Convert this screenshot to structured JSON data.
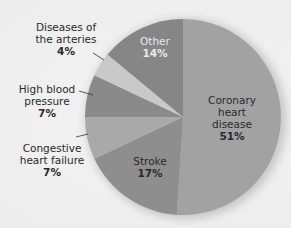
{
  "chart_data": {
    "type": "pie",
    "title": "",
    "start_angle_deg": 0,
    "direction": "clockwise",
    "slices": [
      {
        "label": "Coronary heart disease",
        "value": 51,
        "display": "51%",
        "color": "#a2a2a2"
      },
      {
        "label": "Stroke",
        "value": 17,
        "display": "17%",
        "color": "#8e8e8e"
      },
      {
        "label": "Congestive heart failure",
        "value": 7,
        "display": "7%",
        "color": "#a9a9a9"
      },
      {
        "label": "High blood pressure",
        "value": 7,
        "display": "7%",
        "color": "#8a8a8a"
      },
      {
        "label": "Diseases of the arteries",
        "value": 4,
        "display": "4%",
        "color": "#c9c9c9"
      },
      {
        "label": "Other",
        "value": 14,
        "display": "14%",
        "color": "#868686"
      }
    ],
    "legend": "none (direct labels)"
  },
  "labels": {
    "coronary": {
      "line1": "Coronary",
      "line2": "heart",
      "line3": "disease",
      "pct": "51%"
    },
    "stroke": {
      "line1": "Stroke",
      "pct": "17%"
    },
    "chf": {
      "line1": "Congestive",
      "line2": "heart failure",
      "pct": "7%"
    },
    "hbp": {
      "line1": "High blood",
      "line2": "pressure",
      "pct": "7%"
    },
    "arteries": {
      "line1": "Diseases of",
      "line2": "the arteries",
      "pct": "4%"
    },
    "other": {
      "line1": "Other",
      "pct": "14%"
    }
  }
}
